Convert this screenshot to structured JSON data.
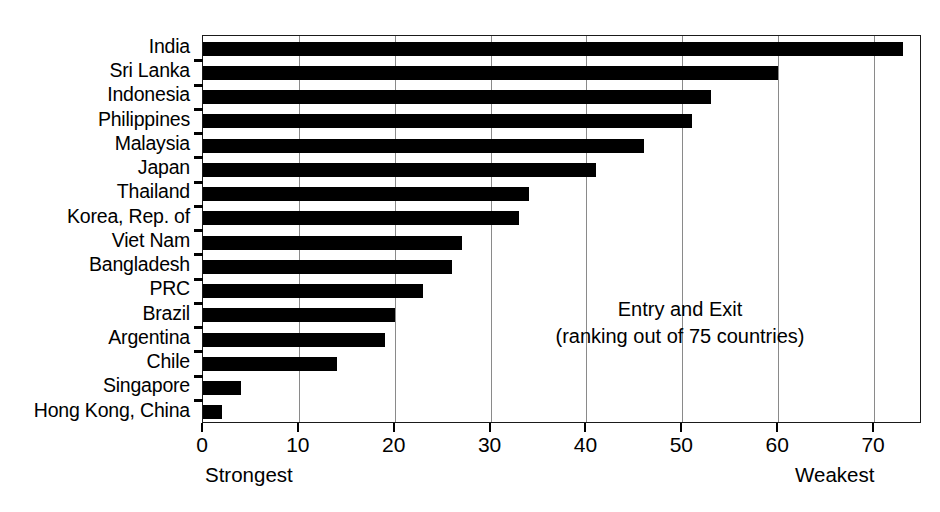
{
  "chart_data": {
    "type": "bar",
    "orientation": "horizontal",
    "title": "",
    "annotation_lines": [
      "Entry and Exit",
      "(ranking out of 75 countries)"
    ],
    "categories": [
      "India",
      "Sri Lanka",
      "Indonesia",
      "Philippines",
      "Malaysia",
      "Japan",
      "Thailand",
      "Korea, Rep. of",
      "Viet Nam",
      "Bangladesh",
      "PRC",
      "Brazil",
      "Argentina",
      "Chile",
      "Singapore",
      "Hong Kong, China"
    ],
    "values": [
      73,
      60,
      53,
      51,
      46,
      41,
      34,
      33,
      27,
      26,
      23,
      20,
      19,
      14,
      4,
      2
    ],
    "xlabel": "",
    "ylabel": "",
    "xlim": [
      0,
      75
    ],
    "xticks": [
      0,
      10,
      20,
      30,
      40,
      50,
      60,
      70
    ],
    "xtick_labels": [
      "0",
      "10",
      "20",
      "30",
      "40",
      "50",
      "60",
      "70"
    ],
    "grid": true,
    "grid_axis": "x",
    "legend": false,
    "bar_color": "#000000",
    "axis_color": "#1a1a1a",
    "grid_color": "#8a8a8a",
    "scale_captions": {
      "left": "Strongest",
      "right": "Weakest"
    }
  }
}
